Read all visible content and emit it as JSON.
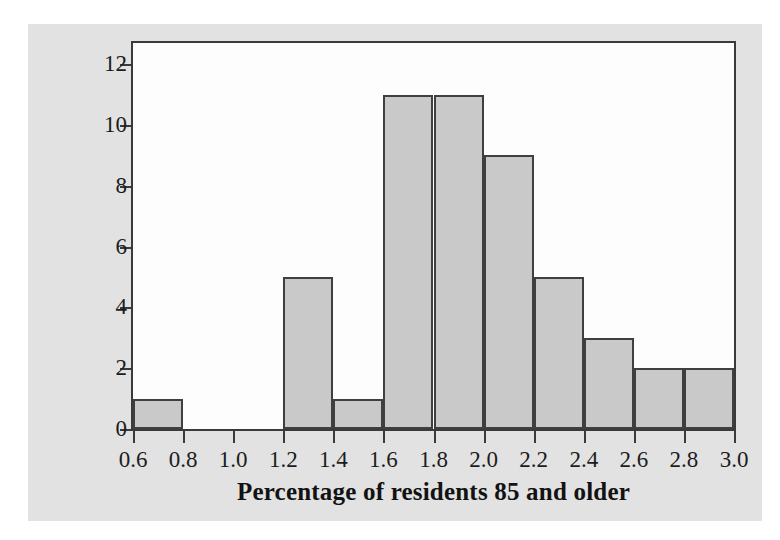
{
  "figure": {
    "panel_color": "#e2e2e2",
    "plot_background": "#fdfdfd",
    "frame_color": "#3a3a3a"
  },
  "chart_data": {
    "type": "bar",
    "title": "",
    "subtitle": "",
    "xlabel": "Percentage of residents 85 and older",
    "ylabel": "Number of states",
    "grid": false,
    "legend": "none",
    "bar_fill_color": "#c9c9c9",
    "bar_edge_color": "#3f3f3f",
    "bin_width": 0.2,
    "xlim": [
      0.6,
      3.0
    ],
    "ylim": [
      0,
      12.7
    ],
    "xticks": [
      0.6,
      0.8,
      1.0,
      1.2,
      1.4,
      1.6,
      1.8,
      2.0,
      2.2,
      2.4,
      2.6,
      2.8,
      3.0
    ],
    "xticklabels": [
      "0.6",
      "0.8",
      "1.0",
      "1.2",
      "1.4",
      "1.6",
      "1.8",
      "2.0",
      "2.2",
      "2.4",
      "2.6",
      "2.8",
      "3.0"
    ],
    "yticks": [
      0,
      2,
      4,
      6,
      8,
      10,
      12
    ],
    "yticklabels": [
      "0",
      "2",
      "4",
      "6",
      "8",
      "10",
      "12"
    ],
    "bin_edges": [
      0.6,
      0.8,
      1.0,
      1.2,
      1.4,
      1.6,
      1.8,
      2.0,
      2.2,
      2.4,
      2.6,
      2.8,
      3.0
    ],
    "categories": [
      "0.6-0.8",
      "0.8-1.0",
      "1.0-1.2",
      "1.2-1.4",
      "1.4-1.6",
      "1.6-1.8",
      "1.8-2.0",
      "2.0-2.2",
      "2.2-2.4",
      "2.4-2.6",
      "2.6-2.8",
      "2.8-3.0"
    ],
    "values": [
      1,
      0,
      0,
      5,
      1,
      11,
      11,
      9,
      5,
      3,
      2,
      2
    ]
  }
}
